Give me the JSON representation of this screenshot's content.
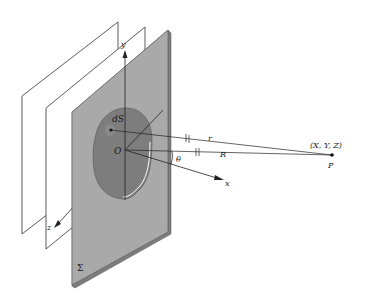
{
  "diagram": {
    "type": "aperture-diffraction-geometry",
    "colors": {
      "screen_fill": "#a9a9a9",
      "screen_edge": "#7d7d7d",
      "aperture_fill": "#ffffff",
      "line": "#222222",
      "surface_element": "#8a8a8a"
    },
    "labels": {
      "axis_y": "y",
      "axis_x": "x",
      "axis_z": "z",
      "origin": "O",
      "surface_element": "dS",
      "distance_r": "r",
      "distance_R": "R",
      "angle": "θ",
      "point_coords": "(X, Y, Z)",
      "point": "P",
      "screen": "Σ"
    },
    "elements": [
      {
        "name": "wavefront-plane-1",
        "description": "back plane (wavefront)"
      },
      {
        "name": "wavefront-plane-2",
        "description": "middle plane (wavefront)"
      },
      {
        "name": "aperture-screen",
        "description": "opaque gray screen Σ with irregular aperture"
      },
      {
        "name": "surface-element",
        "description": "dS area element in aperture"
      },
      {
        "name": "observation-point",
        "description": "point P at (X, Y, Z)"
      }
    ]
  }
}
